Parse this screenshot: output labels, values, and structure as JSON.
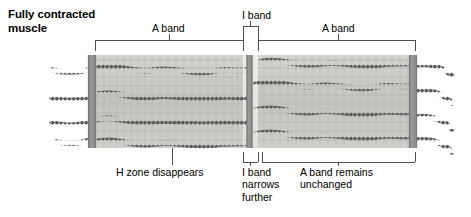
{
  "figure": {
    "title": "Fully contracted\nmuscle",
    "type": "sarcomere-diagram"
  },
  "labels": {
    "a_band_left": "A band",
    "i_band_top": "I band",
    "a_band_right": "A band",
    "h_zone_note": "H zone disappears",
    "i_band_note": "I band\nnarrows\nfurther",
    "a_band_note": "A band remains\nunchanged"
  },
  "colors": {
    "background": "#ffffff",
    "text": "#000000",
    "leader_line": "#3c3c3c",
    "z_disc": "#8e8e8e",
    "z_disc_edge": "#6f6f6f",
    "a_band_fill": "#c9c9c4",
    "i_band_fill": "#e2e2de",
    "filament_dark": "#5a5a5a",
    "filament_light": "#b4b4b4",
    "myosin_line": "#a8a8a4"
  },
  "structure": {
    "z_discs": [
      92,
      249.5,
      411
    ],
    "sarcomere_top": 55,
    "sarcomere_bottom": 148,
    "a_band_left_span": [
      95,
      243
    ],
    "i_band_span": [
      243,
      258
    ],
    "a_band_right_span": [
      258,
      412
    ],
    "filament_rows": 4
  }
}
